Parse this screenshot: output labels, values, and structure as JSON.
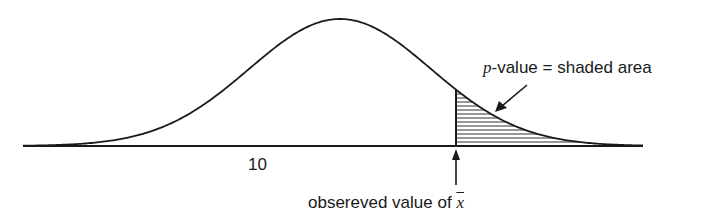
{
  "chart_data": {
    "type": "area",
    "title": "",
    "xlabel": "",
    "ylabel": "",
    "tick_labels": [
      "10"
    ],
    "curve": {
      "shape": "normal",
      "mean_px": 340,
      "sigma_px": 91,
      "peak_y_px": 19,
      "baseline_y_px": 146,
      "x_start_px": 23,
      "x_end_px": 643
    },
    "shaded_region": {
      "from_px": 456,
      "to_px": 643,
      "pattern": "horizontal-hatch"
    },
    "annotations": [
      {
        "text": "p-value = shaded area",
        "points_to": "shaded-region"
      },
      {
        "text": "obsereved value of x̄",
        "points_to": "shaded-region-left-edge"
      }
    ],
    "grid": false,
    "legend": "none"
  },
  "labels": {
    "p_italic": "p",
    "p_rest": "-value = shaded area",
    "tick": "10",
    "observed_prefix": "obsereved value of ",
    "xbar": "x"
  },
  "colors": {
    "ink": "#1a1a1a",
    "background": "#ffffff"
  }
}
